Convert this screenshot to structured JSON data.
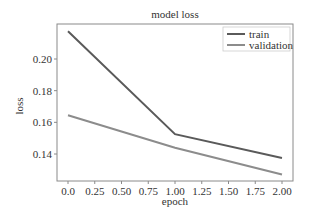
{
  "chart_data": {
    "type": "line",
    "title": "model loss",
    "xlabel": "epoch",
    "ylabel": "loss",
    "x": [
      0,
      1,
      2
    ],
    "series": [
      {
        "name": "train",
        "values": [
          0.2175,
          0.1525,
          0.1375
        ],
        "color": "#5a5a5a"
      },
      {
        "name": "validation",
        "values": [
          0.1645,
          0.144,
          0.127
        ],
        "color": "#8c8c8c"
      }
    ],
    "xlim": [
      -0.1,
      2.1
    ],
    "ylim": [
      0.1235,
      0.2215
    ],
    "xticks": [
      "0.0",
      "0.25",
      "0.50",
      "0.75",
      "1.00",
      "1.25",
      "1.50",
      "1.75",
      "2.00"
    ],
    "xtick_values": [
      0,
      0.25,
      0.5,
      0.75,
      1.0,
      1.25,
      1.5,
      1.75,
      2.0
    ],
    "yticks": [
      "0.14",
      "0.16",
      "0.18",
      "0.20"
    ],
    "ytick_values": [
      0.14,
      0.16,
      0.18,
      0.2
    ],
    "grid": false,
    "legend_position": "upper right"
  }
}
